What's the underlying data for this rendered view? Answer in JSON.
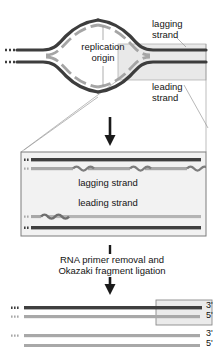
{
  "figure": {
    "title_absent": true,
    "labels": {
      "lagging_strand_top": "lagging\nstrand",
      "leading_strand_top": "leading\nstrand",
      "replication_origin": "replication\norigin",
      "lagging_strand_mid": "lagging strand",
      "leading_strand_mid": "leading strand",
      "step_caption": "RNA primer removal and\nOkazaki fragment ligation",
      "three_prime_top": "3'",
      "five_prime_top": "5'",
      "three_prime_bottom": "3'",
      "five_prime_bottom": "5'"
    },
    "colors": {
      "template_strand": "#3b3b3b",
      "parental_strand_dark": "#4a4a4a",
      "new_strand_gray": "#9b9b9b",
      "primer_gray": "#8a8a8a",
      "box_border": "#8c8c8c",
      "box_fill": "#f1f1f1",
      "highlight_fill": "#e8e8e8",
      "leader_line": "#9a9a9a",
      "arrow": "#1a1a1a",
      "background": "#ffffff"
    },
    "panels": [
      {
        "name": "replication-bubble-panel",
        "description": "DNA replication bubble with two replication forks, origin marked at center, highlighted fork region at right"
      },
      {
        "name": "magnified-fork-panel",
        "description": "Magnified view of right replication fork showing lagging strand with Okazaki fragments and RNA primers, and continuous leading strand"
      },
      {
        "name": "ligated-product-panel",
        "description": "Final ligated duplex DNA molecules after primer removal and ligation, labelled 3' and 5'"
      }
    ],
    "okazaki_fragments": 3,
    "rna_primers_lagging": 3,
    "rna_primers_leading": 1
  }
}
